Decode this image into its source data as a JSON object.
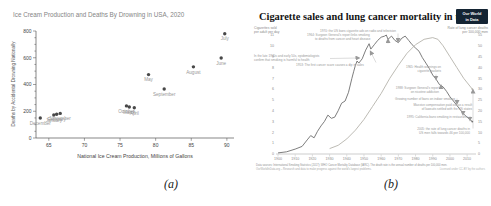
{
  "figure": {
    "caption_a": "(a)",
    "caption_b": "(b)"
  },
  "chart_data": [
    {
      "type": "scatter",
      "title": "Ice Cream Production and Deaths By Drowning in USA, 2020",
      "xlabel": "National Ice Cream Production, Millions of Gallons",
      "ylabel": "Deaths by Accidental Drowning Nationally",
      "xlim": [
        63.2,
        91
      ],
      "ylim": [
        0,
        800
      ],
      "xticks": [
        65,
        70,
        75,
        80,
        85,
        90
      ],
      "yticks_major_step": 200,
      "yticks_minor_step": 50,
      "point_color": "#484848",
      "label_color": "#989898",
      "title_color": "#858585",
      "axis_color": "#555555",
      "points": [
        {
          "label": "December",
          "x": 63.8,
          "y": 150
        },
        {
          "label": "January",
          "x": 65.7,
          "y": 172
        },
        {
          "label": "February",
          "x": 66.1,
          "y": 178
        },
        {
          "label": "November",
          "x": 66.6,
          "y": 184
        },
        {
          "label": "October",
          "x": 75.9,
          "y": 240
        },
        {
          "label": "March",
          "x": 76.3,
          "y": 232
        },
        {
          "label": "April",
          "x": 77.0,
          "y": 226
        },
        {
          "label": "May",
          "x": 79.0,
          "y": 474
        },
        {
          "label": "September",
          "x": 81.2,
          "y": 366
        },
        {
          "label": "August",
          "x": 85.3,
          "y": 532
        },
        {
          "label": "June",
          "x": 89.2,
          "y": 598
        },
        {
          "label": "July",
          "x": 89.7,
          "y": 780
        }
      ]
    },
    {
      "type": "line",
      "title": "Cigarette sales and lung cancer mortality in the US",
      "title_color": "#131313",
      "logo": {
        "line1": "Our World",
        "line2": "in Data",
        "bg": "#142433",
        "fg": "#ffffff"
      },
      "left_axis": {
        "title_lines": [
          "Cigarettes sold",
          "per adult per day"
        ],
        "min": 0,
        "max": 11,
        "tick_step": 1
      },
      "right_axis": {
        "title_lines": [
          "Rate of lung cancer deaths",
          "per 100,000 men"
        ],
        "min": 0,
        "max": 55,
        "tick_step": 5
      },
      "x_axis": {
        "min": 1900,
        "max": 2014,
        "ticks": [
          1900,
          1910,
          1920,
          1930,
          1940,
          1950,
          1960,
          1970,
          1980,
          1990,
          2000,
          2010
        ]
      },
      "series": [
        {
          "name": "Cigarette sales per adult per day",
          "axis": "left",
          "color": "#6e6e6e",
          "points": [
            [
              1900,
              0.1
            ],
            [
              1905,
              0.2
            ],
            [
              1910,
              0.45
            ],
            [
              1914,
              0.7
            ],
            [
              1917,
              1.3
            ],
            [
              1919,
              1.7
            ],
            [
              1921,
              1.5
            ],
            [
              1923,
              2.1
            ],
            [
              1925,
              2.6
            ],
            [
              1927,
              3.0
            ],
            [
              1929,
              3.6
            ],
            [
              1931,
              3.3
            ],
            [
              1933,
              3.4
            ],
            [
              1935,
              4.0
            ],
            [
              1937,
              4.7
            ],
            [
              1939,
              4.9
            ],
            [
              1941,
              5.7
            ],
            [
              1943,
              7.0
            ],
            [
              1944,
              7.6
            ],
            [
              1945,
              8.2
            ],
            [
              1946,
              8.6
            ],
            [
              1947,
              8.4
            ],
            [
              1949,
              8.8
            ],
            [
              1951,
              9.6
            ],
            [
              1953,
              10.2
            ],
            [
              1954,
              9.7
            ],
            [
              1956,
              10.1
            ],
            [
              1958,
              10.5
            ],
            [
              1960,
              10.8
            ],
            [
              1962,
              10.9
            ],
            [
              1963,
              11.0
            ],
            [
              1964,
              10.6
            ],
            [
              1966,
              10.9
            ],
            [
              1968,
              10.5
            ],
            [
              1970,
              10.3
            ],
            [
              1972,
              10.7
            ],
            [
              1974,
              10.9
            ],
            [
              1976,
              10.5
            ],
            [
              1978,
              10.1
            ],
            [
              1980,
              9.8
            ],
            [
              1982,
              9.5
            ],
            [
              1984,
              8.9
            ],
            [
              1986,
              8.4
            ],
            [
              1988,
              7.9
            ],
            [
              1990,
              7.3
            ],
            [
              1992,
              6.9
            ],
            [
              1994,
              6.4
            ],
            [
              1996,
              6.2
            ],
            [
              1998,
              5.8
            ],
            [
              2000,
              5.3
            ],
            [
              2002,
              4.9
            ],
            [
              2004,
              4.5
            ],
            [
              2006,
              4.1
            ],
            [
              2008,
              3.7
            ],
            [
              2010,
              3.4
            ],
            [
              2013,
              3.0
            ]
          ]
        },
        {
          "name": "Rate of lung cancer deaths per 100,000 men",
          "axis": "right",
          "color": "#b6b3ab",
          "points": [
            [
              1930,
              2.5
            ],
            [
              1935,
              4
            ],
            [
              1940,
              7
            ],
            [
              1945,
              11
            ],
            [
              1950,
              16
            ],
            [
              1955,
              22
            ],
            [
              1960,
              28
            ],
            [
              1965,
              35
            ],
            [
              1970,
              41
            ],
            [
              1975,
              46.5
            ],
            [
              1980,
              50.5
            ],
            [
              1985,
              53
            ],
            [
              1990,
              53.8
            ],
            [
              1993,
              53
            ],
            [
              1996,
              50
            ],
            [
              2000,
              45
            ],
            [
              2004,
              40
            ],
            [
              2008,
              35
            ],
            [
              2013,
              30
            ]
          ]
        }
      ],
      "annotations": [
        {
          "id": "ads-ban",
          "lines": [
            "1970: the US bans cigarette ads on radio and television"
          ],
          "x": 70,
          "y": 29.5,
          "align": "start",
          "arrow": {
            "x1": 148,
            "y1": 31.5,
            "x2": 148,
            "y2": 38.5
          }
        },
        {
          "id": "surgeon-1964",
          "lines": [
            "1964: Surgeon General's report links smoking",
            "to deaths from cancer and heart disease"
          ],
          "x": 57,
          "y": 33.5,
          "align": "start",
          "indent": 8,
          "arrow": {
            "x1": 138,
            "y1": 41.5,
            "x2": 138,
            "y2": 38.5
          }
        },
        {
          "id": "epidemiologists",
          "lines": [
            "In the late 1940s and early 50s, epidemiologists",
            "confirm that smoking is harmful to health"
          ],
          "x": 4,
          "y": 54.5,
          "align": "start",
          "arrow": {
            "x1": 80,
            "y1": 56.5,
            "x2": 108,
            "y2": 56
          }
        },
        {
          "id": "cancer-scare",
          "lines": [
            "1953: The first cancer scare causes a dip in sales"
          ],
          "x": 46,
          "y": 63.5,
          "align": "start",
          "arrow": {
            "x1": 126,
            "y1": 60.5,
            "x2": 121,
            "y2": 50.5
          }
        },
        {
          "id": "warnings",
          "lines": [
            "1965: Health warnings on",
            "cigarette packets"
          ],
          "x": 191,
          "y": 66,
          "align": "end",
          "arrow": {
            "x1": 186,
            "y1": 72.5,
            "x2": 186,
            "y2": 76
          }
        },
        {
          "id": "surgeon-nicotine",
          "lines": [
            "1988: Surgeon General's report",
            "on nicotine addiction"
          ],
          "x": 189,
          "y": 87,
          "align": "end",
          "arrow": {
            "x1": 191,
            "y1": 85.8,
            "x2": 191,
            "y2": 84.6
          }
        },
        {
          "id": "smoking-bans",
          "lines": [
            "Growing number of bans on indoor smoking"
          ],
          "x": 205,
          "y": 98,
          "align": "end",
          "arrow": {
            "x1": 207,
            "y1": 96.5,
            "x2": 207,
            "y2": 100.5
          }
        },
        {
          "id": "compensation",
          "lines": [
            "Massive compensation paid out as a result",
            "of lawsuits settled with the US states"
          ],
          "x": 222,
          "y": 104,
          "align": "end",
          "arrow": {
            "x1": 213,
            "y1": 110,
            "x2": 213,
            "y2": 111.5
          }
        },
        {
          "id": "california",
          "lines": [
            "1995: California bans smoking in restaurants"
          ],
          "x": 218,
          "y": 115.5,
          "align": "end",
          "arrow": {
            "x1": 220,
            "y1": 114,
            "x2": 220,
            "y2": 117
          }
        },
        {
          "id": "rate-falls",
          "lines": [
            "2005: the rate of lung cancer deaths in",
            "US men falls towards 46 per 100,000"
          ],
          "x": 220,
          "y": 128,
          "align": "end",
          "arrow": {
            "x1": 223,
            "y1": 126.5,
            "x2": 223,
            "y2": 89
          }
        }
      ],
      "footer": {
        "left_lines": [
          "Data sources: International Smoking Statistics (2017); WHO Cancer Mortality Database (IARC). The death rate is the annual number of deaths per 100,000 men.",
          "OurWorldInData.org – Research and data to make progress against the world's largest problems."
        ],
        "right": "Licensed under CC-BY by the authors"
      }
    }
  ]
}
